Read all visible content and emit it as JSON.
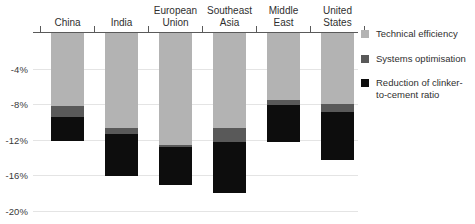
{
  "chart_data": {
    "type": "bar",
    "title": "",
    "subtitle": "",
    "xlabel": "",
    "ylabel": "",
    "stacked": true,
    "orientation": "vertical",
    "grid": true,
    "legend_position": "right",
    "ylim": [
      -20,
      0
    ],
    "yticks": [
      -4,
      -8,
      -12,
      -16,
      -20
    ],
    "ytick_labels": [
      "-4%",
      "-8%",
      "-12%",
      "-16%",
      "-20%"
    ],
    "categories": [
      "China",
      "India",
      "European\nUnion",
      "Southeast\nAsia",
      "Middle\nEast",
      "United\nStates"
    ],
    "series": [
      {
        "name": "Technical efficiency",
        "color": "#b3b3b3",
        "values": [
          -8.2,
          -10.7,
          -12.6,
          -10.7,
          -7.5,
          -8.0
        ]
      },
      {
        "name": "Systems optimisation",
        "color": "#595959",
        "values": [
          -1.2,
          -0.6,
          -0.2,
          -1.6,
          -0.6,
          -0.9
        ]
      },
      {
        "name": "Reduction of clinker-\nto-cement ratio",
        "color": "#0d0d0d",
        "values": [
          -2.7,
          -4.8,
          -4.3,
          -5.7,
          -4.2,
          -5.4
        ]
      }
    ],
    "totals": [
      -12.1,
      -16.1,
      -17.1,
      -18.0,
      -12.3,
      -14.3
    ]
  },
  "legend": {
    "items": [
      {
        "label": "Technical efficiency",
        "color": "#b3b3b3"
      },
      {
        "label": "Systems optimisation",
        "color": "#595959"
      },
      {
        "label": "Reduction of clinker-\nto-cement ratio",
        "color": "#0d0d0d"
      }
    ]
  },
  "axis": {
    "grid_color": "#e4e4e4",
    "axis_line_color": "#5a5a5a"
  }
}
